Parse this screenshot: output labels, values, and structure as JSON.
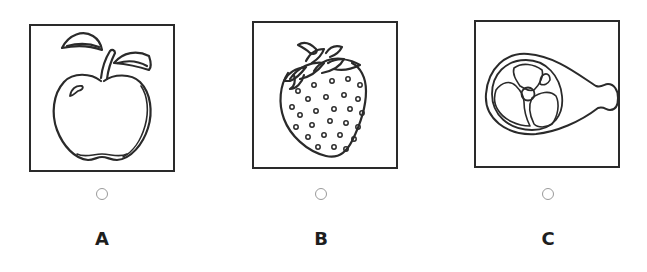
{
  "question": {
    "options": [
      {
        "letter": "A",
        "image": "apple-illustration",
        "selected": false
      },
      {
        "letter": "B",
        "image": "strawberry-illustration",
        "selected": false
      },
      {
        "letter": "C",
        "image": "ham-illustration",
        "selected": false
      }
    ]
  },
  "colors": {
    "line": "#2a2a2a",
    "radio_border": "#9a9a9a",
    "label": "#1e1e1e",
    "background": "#ffffff"
  }
}
